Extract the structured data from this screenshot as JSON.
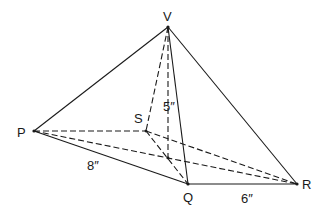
{
  "diagram": {
    "vertices": {
      "V": {
        "label": "V",
        "x": 168,
        "y": 27
      },
      "P": {
        "label": "P",
        "x": 34,
        "y": 131
      },
      "S": {
        "label": "S",
        "x": 146,
        "y": 131
      },
      "Q": {
        "label": "Q",
        "x": 188,
        "y": 184
      },
      "R": {
        "label": "R",
        "x": 297,
        "y": 184
      },
      "O": {
        "x": 168,
        "y": 158
      }
    },
    "measurements": {
      "height": "5″",
      "side_pq": "8″",
      "side_qr": "6″"
    },
    "colors": {
      "line": "#1a1a1a",
      "background": "#ffffff"
    }
  }
}
